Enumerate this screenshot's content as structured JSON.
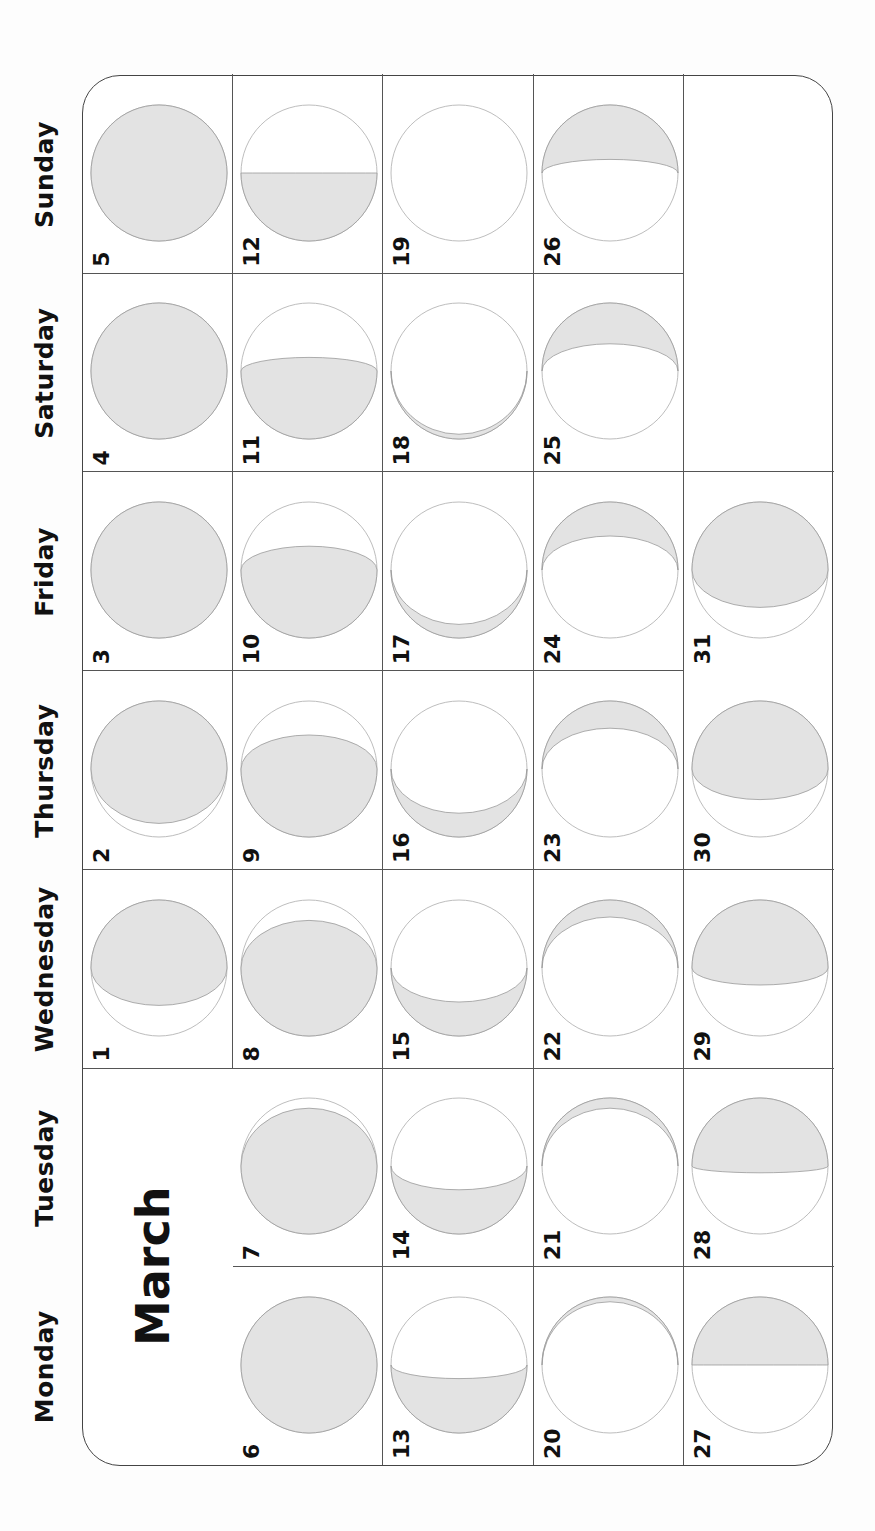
{
  "calendar": {
    "month": "March",
    "weekdays": [
      "Monday",
      "Tuesday",
      "Wednesday",
      "Thursday",
      "Friday",
      "Saturday",
      "Sunday"
    ],
    "first_weekday_index": 2,
    "days_in_month": 31,
    "colors": {
      "moon_fill": "#e3e3e3",
      "moon_outline": "#bdbdbd",
      "grid": "#555555",
      "text": "#111111"
    },
    "days": [
      {
        "day": 1,
        "lit": "right",
        "k": 0.55
      },
      {
        "day": 2,
        "lit": "right",
        "k": 0.8
      },
      {
        "day": 3,
        "lit": "full",
        "k": 1
      },
      {
        "day": 4,
        "lit": "full",
        "k": 1
      },
      {
        "day": 5,
        "lit": "full",
        "k": 1
      },
      {
        "day": 6,
        "lit": "full",
        "k": 1
      },
      {
        "day": 7,
        "lit": "left",
        "k": 0.85
      },
      {
        "day": 8,
        "lit": "left",
        "k": 0.7
      },
      {
        "day": 9,
        "lit": "left",
        "k": 0.5
      },
      {
        "day": 10,
        "lit": "left",
        "k": 0.35
      },
      {
        "day": 11,
        "lit": "left",
        "k": 0.2
      },
      {
        "day": 12,
        "lit": "left",
        "k": 0.0
      },
      {
        "day": 13,
        "lit": "left",
        "k": -0.2
      },
      {
        "day": 14,
        "lit": "left",
        "k": -0.35
      },
      {
        "day": 15,
        "lit": "left",
        "k": -0.5
      },
      {
        "day": 16,
        "lit": "left",
        "k": -0.65
      },
      {
        "day": 17,
        "lit": "left",
        "k": -0.8
      },
      {
        "day": 18,
        "lit": "left",
        "k": -0.93
      },
      {
        "day": 19,
        "lit": "new",
        "k": -1
      },
      {
        "day": 20,
        "lit": "right",
        "k": -0.93
      },
      {
        "day": 21,
        "lit": "right",
        "k": -0.85
      },
      {
        "day": 22,
        "lit": "right",
        "k": -0.75
      },
      {
        "day": 23,
        "lit": "right",
        "k": -0.6
      },
      {
        "day": 24,
        "lit": "right",
        "k": -0.5
      },
      {
        "day": 25,
        "lit": "right",
        "k": -0.4
      },
      {
        "day": 26,
        "lit": "right",
        "k": -0.2
      },
      {
        "day": 27,
        "lit": "right",
        "k": 0.0
      },
      {
        "day": 28,
        "lit": "right",
        "k": 0.1
      },
      {
        "day": 29,
        "lit": "right",
        "k": 0.25
      },
      {
        "day": 30,
        "lit": "right",
        "k": 0.45
      },
      {
        "day": 31,
        "lit": "right",
        "k": 0.55
      }
    ]
  }
}
